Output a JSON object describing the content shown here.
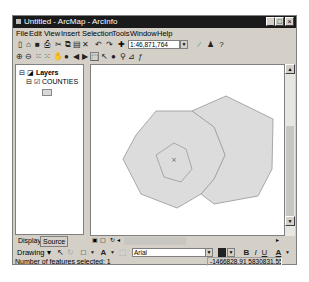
{
  "window": {
    "title": "Untitled - ArcMap - ArcInfo",
    "controls": {
      "minimize": "_",
      "maximize": "□",
      "close": "×"
    }
  },
  "menubar": {
    "items": [
      "File",
      "Edit",
      "View",
      "Insert",
      "Selection",
      "Tools",
      "Window",
      "Help"
    ]
  },
  "standard_toolbar": {
    "icons": [
      "new-icon",
      "open-icon",
      "save-icon",
      "print-icon",
      "cut-icon",
      "copy-icon",
      "paste-icon",
      "delete-icon",
      "undo-icon",
      "redo-icon",
      "add-data-icon"
    ],
    "map_scale": "1:46,871,764",
    "right_icons": [
      "editor-icon",
      "arctoolbox-icon",
      "whats-this-icon"
    ]
  },
  "tools_toolbar": {
    "icons": [
      "zoom-in-icon",
      "zoom-out-icon",
      "fixed-zoom-in-icon",
      "fixed-zoom-out-icon",
      "pan-icon",
      "full-extent-icon",
      "back-icon",
      "forward-icon",
      "select-features-icon",
      "select-elements-icon",
      "identify-icon",
      "find-icon",
      "measure-icon",
      "hyperlink-icon"
    ]
  },
  "toc": {
    "root": "Layers",
    "layers": [
      {
        "name": "COUNTIES",
        "checked": true,
        "symbol_color": "#d9d9d9"
      }
    ],
    "tabs": [
      "Display",
      "Source"
    ],
    "active_tab": "Source"
  },
  "map": {
    "polygon_fill": "#dcdcdc",
    "polygon_stroke": "#a8a8a8",
    "center_marker": "×"
  },
  "drawing_toolbar": {
    "label": "Drawing",
    "font": "Arial",
    "format_buttons": [
      "B",
      "I",
      "U"
    ]
  },
  "statusbar": {
    "message": "Number of features selected: 1",
    "coordinates": "-1466828.91  5830831.55 Meters"
  }
}
